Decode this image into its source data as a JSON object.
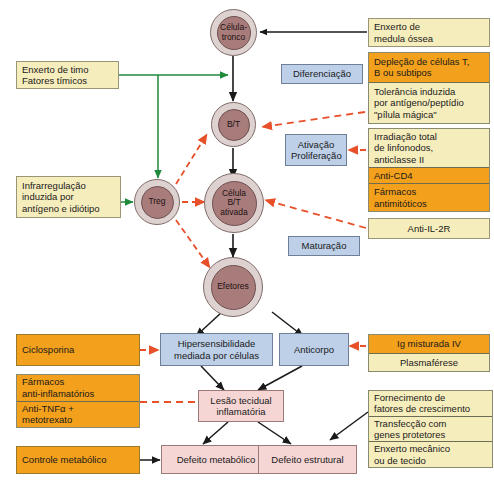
{
  "diagram": {
    "colors": {
      "cream": "#f6edbd",
      "orange": "#f3a01c",
      "blue": "#bdd0e8",
      "pink": "#f6d6d4",
      "cell_cytoplasm": "#ded2d0",
      "cell_nucleus": "#a97c7c",
      "arrow_black": "#1a1a1a",
      "arrow_green": "#1f8a3c",
      "arrow_orange": "#e8502a"
    }
  },
  "cells": {
    "stem": {
      "lines": [
        "Célula-",
        "tronco"
      ]
    },
    "bt": {
      "lines": [
        "B/T"
      ]
    },
    "treg": {
      "lines": [
        "Treg"
      ]
    },
    "activated": {
      "lines": [
        "Célula",
        "B/T",
        "ativada"
      ]
    },
    "effectors": {
      "lines": [
        "Efetores"
      ]
    }
  },
  "process_boxes": {
    "differentiation": {
      "lines": [
        "Diferenciação"
      ]
    },
    "activation": {
      "lines": [
        "Ativação",
        "Proliferação"
      ]
    },
    "maturation": {
      "lines": [
        "Maturação"
      ]
    }
  },
  "left_boxes": {
    "thymus": {
      "lines": [
        "Enxerto de timo",
        "Fatores tímicos"
      ]
    },
    "downregulation": {
      "lines": [
        "Infrarregulação",
        "induzida por",
        "antígeno e idiótipo"
      ]
    },
    "ciclosporina": {
      "lines": [
        "Ciclosporina"
      ]
    },
    "anti_inflam_stack": [
      {
        "lines": [
          "Fármacos",
          "anti-inflamatórios"
        ]
      },
      {
        "lines": [
          "Anti-TNFα +",
          "metotrexato"
        ]
      }
    ],
    "metabolic_control": {
      "lines": [
        "Controle metabólico"
      ]
    }
  },
  "right_boxes": {
    "bone_marrow": {
      "lines": [
        "Enxerto de",
        "medula óssea"
      ]
    },
    "tolerance_stack": [
      {
        "lines": [
          "Depleção de células T,",
          "B ou subtipos"
        ]
      },
      {
        "lines": [
          "Tolerância induzida",
          "por antígeno/peptídio",
          "\"pílula mágica\""
        ]
      }
    ],
    "irradiation_stack": [
      {
        "lines": [
          "Irradiação total",
          "de linfonodos,",
          "anticlasse II"
        ]
      },
      {
        "lines": [
          "Anti-CD4"
        ]
      },
      {
        "lines": [
          "Fármacos",
          "antimitóticos"
        ]
      }
    ],
    "anti_il2r": {
      "lines": [
        "Anti-IL-2R"
      ]
    },
    "ig_stack": [
      {
        "lines": [
          "Ig misturada IV"
        ]
      },
      {
        "lines": [
          "Plasmaférese"
        ]
      }
    ],
    "growth_stack": [
      {
        "lines": [
          "Fornecimento de",
          "fatores de crescimento"
        ]
      },
      {
        "lines": [
          "Transfecção com",
          "genes protetores"
        ]
      },
      {
        "lines": [
          "Enxerto mecânico",
          "ou de tecido"
        ]
      }
    ]
  },
  "outcome_boxes": {
    "hypersensitivity": {
      "lines": [
        "Hipersensibilidade",
        "mediada por células"
      ]
    },
    "antibody": {
      "lines": [
        "Anticorpo"
      ]
    },
    "tissue_lesion": {
      "lines": [
        "Lesão tecidual",
        "inflamatória"
      ]
    },
    "metabolic_defect": {
      "lines": [
        "Defeito metabólico"
      ]
    },
    "structural_defect": {
      "lines": [
        "Defeito estrutural"
      ]
    }
  }
}
